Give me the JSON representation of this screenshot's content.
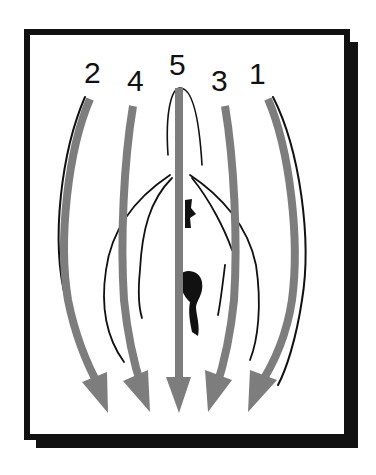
{
  "diagram": {
    "type": "anatomical-direction-diagram",
    "frame": {
      "border_color": "#111111",
      "background": "#ffffff",
      "shadow": true
    },
    "arrow_color": "#7d7d7d",
    "outline_color": "#111111",
    "arrows": [
      {
        "label": "2",
        "order": 2,
        "position": "far-left",
        "direction": "down"
      },
      {
        "label": "4",
        "order": 4,
        "position": "left",
        "direction": "down"
      },
      {
        "label": "5",
        "order": 5,
        "position": "center",
        "direction": "down"
      },
      {
        "label": "3",
        "order": 3,
        "position": "right",
        "direction": "down"
      },
      {
        "label": "1",
        "order": 1,
        "position": "far-right",
        "direction": "down"
      }
    ]
  }
}
